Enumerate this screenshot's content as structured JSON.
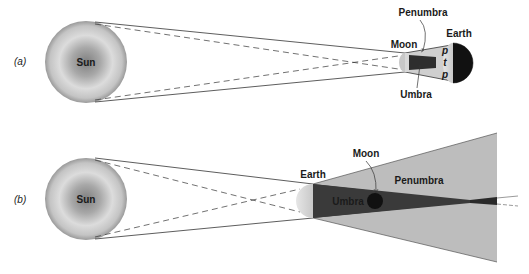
{
  "diagram": {
    "panels": [
      {
        "id": "a",
        "label": "(a)",
        "bodies": {
          "sun": "Sun",
          "moon": "Moon",
          "earth": "Earth"
        },
        "regions": {
          "penumbra": "Penumbra",
          "umbra": "Umbra"
        },
        "markers": [
          "p",
          "t",
          "p"
        ]
      },
      {
        "id": "b",
        "label": "(b)",
        "bodies": {
          "sun": "Sun",
          "earth": "Earth",
          "moon": "Moon"
        },
        "regions": {
          "penumbra": "Penumbra",
          "umbra": "Umbra"
        }
      }
    ],
    "colors": {
      "sun_center": "#8a8a8a",
      "sun_edge": "#d8d8d8",
      "penumbra": "#bdbdbd",
      "umbra": "#3a3a3a",
      "dark_side": "#111111",
      "lit_side": "#d4d4d4",
      "line": "#333333"
    }
  }
}
